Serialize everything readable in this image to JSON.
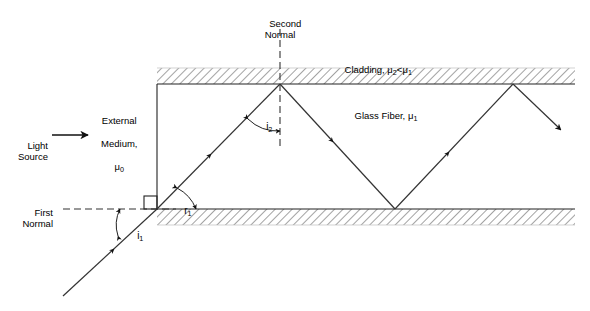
{
  "figure": {
    "type": "optics-ray-diagram"
  },
  "labels": {
    "light_source": "Light\nSource",
    "external_medium_line1": "External",
    "external_medium_line2": "Medium,",
    "external_medium_symbol": "μ",
    "external_medium_sub": "0",
    "first_normal": "First\nNormal",
    "second_normal": "Second\nNormal",
    "cladding_text": "Cladding, ",
    "cladding_mu2": "μ",
    "cladding_sub2": "2",
    "cladding_lt": "<",
    "cladding_mu1": "μ",
    "cladding_sub1": "1",
    "glass_fiber_text": "Glass Fiber, ",
    "glass_fiber_mu": "μ",
    "glass_fiber_sub": "1",
    "angle_i1": "i",
    "angle_i1_sub": "1",
    "angle_r1": "r",
    "angle_r1_sub": "1",
    "angle_i2": "i",
    "angle_i2_sub": "2"
  },
  "colors": {
    "stroke": "#222222",
    "hatch": "#555555",
    "background": "#ffffff",
    "text": "#000000"
  },
  "geometry": {
    "fiber_left_x": 157,
    "fiber_top_y": 84,
    "fiber_bottom_y": 209,
    "fiber_right_x": 575,
    "cladding_thickness": 16,
    "entry_point": [
      157,
      209
    ],
    "ray_start": [
      63,
      296
    ],
    "reflection_points": [
      [
        280,
        84
      ],
      [
        395,
        209
      ],
      [
        513,
        84
      ]
    ],
    "exit_point": [
      563,
      131
    ]
  }
}
